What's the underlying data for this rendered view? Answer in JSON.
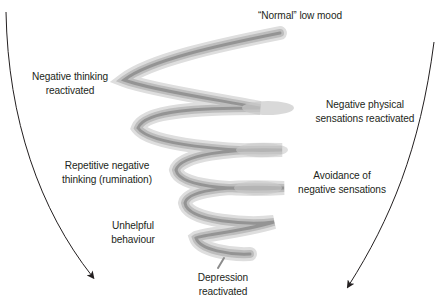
{
  "diagram": {
    "type": "downward spiral",
    "labels": {
      "top": "“Normal” low mood",
      "negative_thinking": [
        "Negative thinking",
        "reactivated"
      ],
      "negative_physical": [
        "Negative physical",
        "sensations reactivated"
      ],
      "rumination": [
        "Repetitive negative",
        "thinking (rumination)"
      ],
      "avoidance": [
        "Avoidance of",
        "negative sensations"
      ],
      "unhelpful": [
        "Unhelpful",
        "behaviour"
      ],
      "bottom": [
        "Depression",
        "reactivated"
      ]
    },
    "arrows": {
      "left": "downward-curved-arrow",
      "right": "downward-curved-arrow"
    },
    "colors": {
      "spiral_light": "#d9d9d9",
      "spiral_mid": "#b3b3b3",
      "spiral_dark": "#8c8c8c",
      "text": "#231f20",
      "arrow": "#231f20"
    }
  }
}
